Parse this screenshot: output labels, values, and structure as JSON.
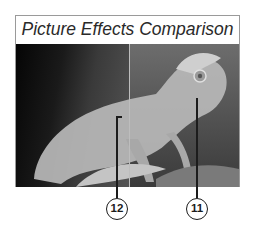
{
  "figure": {
    "title": "Picture Effects Comparison",
    "image_subject": "chameleon on branch, split comparison",
    "callouts": [
      {
        "number": "12",
        "label_target": "left-right split / original side"
      },
      {
        "number": "11",
        "label_target": "effect-applied side"
      }
    ]
  }
}
